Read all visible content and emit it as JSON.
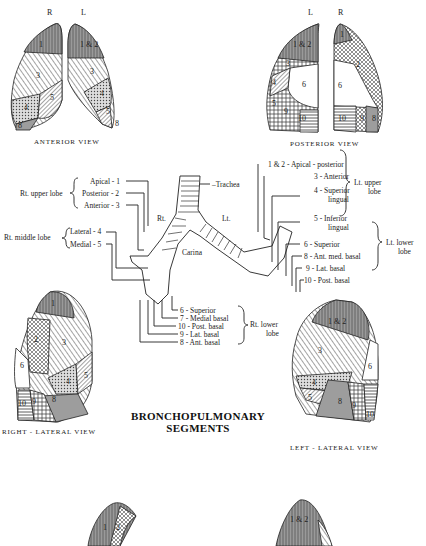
{
  "title": {
    "line1": "BRONCHOPULMONARY",
    "line2": "SEGMENTS"
  },
  "views": {
    "anterior": {
      "label": "ANTERIOR VIEW",
      "side_left": "R",
      "side_right": "L",
      "right_lung_segments": [
        "1",
        "2",
        "3",
        "4",
        "5",
        "8"
      ],
      "left_lung_segments": [
        "1 & 2",
        "3",
        "4",
        "5",
        "8"
      ]
    },
    "posterior": {
      "label": "POSTERIOR VIEW",
      "side_left": "L",
      "side_right": "R",
      "left_lung_segments": [
        "1 & 2",
        "3",
        "4",
        "5",
        "6",
        "8",
        "9",
        "10"
      ],
      "right_lung_segments": [
        "1",
        "2",
        "6",
        "10",
        "9",
        "8"
      ]
    },
    "right_lateral": {
      "label": "RIGHT - LATERAL VIEW",
      "segments": [
        "1",
        "2",
        "3",
        "4",
        "5",
        "6",
        "8",
        "9",
        "10"
      ]
    },
    "left_lateral": {
      "label": "LEFT - LATERAL VIEW",
      "segments": [
        "1 & 2",
        "3",
        "4",
        "5",
        "6",
        "8",
        "9",
        "10"
      ]
    },
    "bottom_left": {
      "segments": [
        "1",
        "2"
      ]
    },
    "bottom_right": {
      "segments": [
        "1 & 2"
      ]
    }
  },
  "bronchial_tree": {
    "trachea": "Trachea",
    "carina": "Carina",
    "rt": "Rt.",
    "lt": "Lt."
  },
  "right_groups": [
    {
      "lobe": "Rt. upper lobe",
      "items": [
        "Apical - 1",
        "Posterior - 2",
        "Anterior - 3"
      ]
    },
    {
      "lobe": "Rt. middle lobe",
      "items": [
        "Lateral - 4",
        "Medial - 5"
      ]
    },
    {
      "lobe": "Rt. lower lobe",
      "lobe_line1": "Rt. lower",
      "lobe_line2": "lobe",
      "items": [
        "6 - Superior",
        "7 - Medial basal",
        "10 - Post. basal",
        "9 - Lat. basal",
        "8 - Ant. basal"
      ]
    }
  ],
  "left_groups": [
    {
      "lobe_line1": "Lt. upper",
      "lobe_line2": "lobe",
      "items": [
        "1 & 2 - Apical - posterior",
        "3 - Anterior",
        "4 - Superior",
        "lingual",
        "5 - Inferior",
        "lingual"
      ]
    },
    {
      "lobe_line1": "Lt. lower",
      "lobe_line2": "lobe",
      "items": [
        "6 - Superior",
        "8 - Ant. med. basal",
        "9 - Lat. basal",
        "10 - Post. basal"
      ]
    }
  ],
  "colors": {
    "ink": "#1a1a1a",
    "shade_dark": "#8a8a8a",
    "shade_mid": "#b5b5b5",
    "paper": "#ffffff"
  }
}
